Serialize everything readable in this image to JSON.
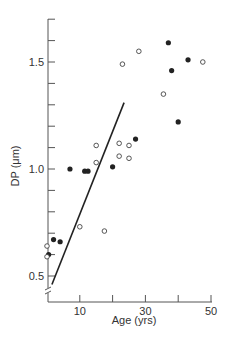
{
  "chart_data": {
    "type": "scatter",
    "title": "",
    "xlabel": "Age (yrs)",
    "ylabel": "DP (μm)",
    "xlim": [
      0,
      50
    ],
    "ylim": [
      0.42,
      1.7
    ],
    "x_ticks": [
      0,
      10,
      20,
      30,
      40,
      50
    ],
    "x_tick_labels": [
      "10",
      "30",
      "50"
    ],
    "x_tick_label_values": [
      10,
      30,
      50
    ],
    "y_ticks": [
      0.5,
      0.6,
      0.7,
      0.8,
      0.9,
      1.0,
      1.1,
      1.2,
      1.3,
      1.4,
      1.5,
      1.6,
      1.7
    ],
    "y_tick_labels": [
      "0.5",
      "1.0",
      "1.5"
    ],
    "y_tick_label_values": [
      0.5,
      1.0,
      1.5
    ],
    "y_axis_break": true,
    "grid": false,
    "legend": null,
    "series": [
      {
        "name": "filled circles",
        "marker": "filled-circle",
        "points": [
          {
            "x": 0.5,
            "y": 0.6
          },
          {
            "x": 2,
            "y": 0.67
          },
          {
            "x": 4,
            "y": 0.66
          },
          {
            "x": 7,
            "y": 1.0
          },
          {
            "x": 11.5,
            "y": 0.99
          },
          {
            "x": 12.5,
            "y": 0.99
          },
          {
            "x": 20,
            "y": 1.01
          },
          {
            "x": 27,
            "y": 1.14
          },
          {
            "x": 37,
            "y": 1.59
          },
          {
            "x": 38,
            "y": 1.46
          },
          {
            "x": 40,
            "y": 1.22
          },
          {
            "x": 43,
            "y": 1.51
          }
        ]
      },
      {
        "name": "open circles",
        "marker": "open-circle",
        "points": [
          {
            "x": 0,
            "y": 0.64
          },
          {
            "x": 0,
            "y": 0.59
          },
          {
            "x": 10,
            "y": 0.73
          },
          {
            "x": 17.5,
            "y": 0.71
          },
          {
            "x": 15,
            "y": 1.03
          },
          {
            "x": 15,
            "y": 1.11
          },
          {
            "x": 22,
            "y": 1.12
          },
          {
            "x": 22,
            "y": 1.06
          },
          {
            "x": 25,
            "y": 1.11
          },
          {
            "x": 25,
            "y": 1.05
          },
          {
            "x": 23,
            "y": 1.49
          },
          {
            "x": 28,
            "y": 1.55
          },
          {
            "x": 35.5,
            "y": 1.35
          },
          {
            "x": 47.5,
            "y": 1.5
          }
        ]
      },
      {
        "name": "regression line",
        "type": "line",
        "points": [
          {
            "x": 1.5,
            "y": 0.46
          },
          {
            "x": 23.5,
            "y": 1.31
          }
        ]
      }
    ]
  },
  "style": {
    "ink": "#222222",
    "axis": "#555555",
    "background": "#ffffff"
  }
}
